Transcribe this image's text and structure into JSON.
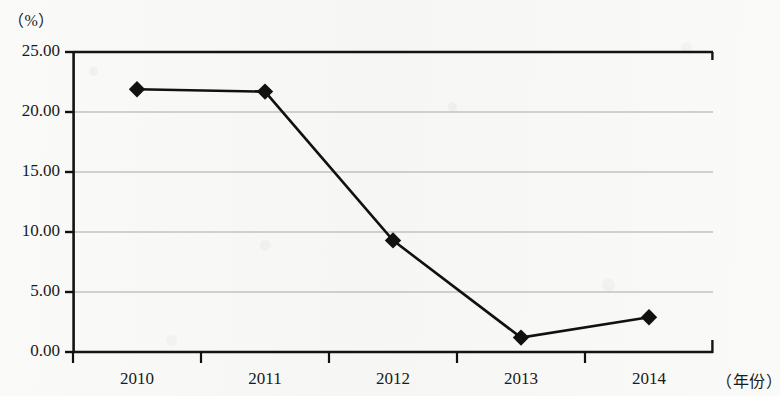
{
  "chart_data": {
    "type": "line",
    "title": "",
    "xlabel": "（年份）",
    "ylabel": "（%）",
    "categories": [
      "2010",
      "2011",
      "2012",
      "2013",
      "2014"
    ],
    "series": [
      {
        "name": "",
        "values": [
          21.9,
          21.7,
          9.3,
          1.2,
          2.9
        ]
      }
    ],
    "ylim": [
      0,
      25
    ],
    "ytick_labels": [
      "0.00",
      "5.00",
      "10.00",
      "15.00",
      "20.00",
      "25.00"
    ],
    "ytick_values": [
      0,
      5,
      10,
      15,
      20,
      25
    ],
    "grid": true,
    "grid_axis": "y",
    "legend": "none",
    "marker": "diamond",
    "line_color": "#111111",
    "marker_color": "#111111",
    "grid_color": "#a8a8a8",
    "axis_color": "#111111"
  },
  "axes": {
    "y_unit": "（%）",
    "x_unit": "（年份）"
  }
}
